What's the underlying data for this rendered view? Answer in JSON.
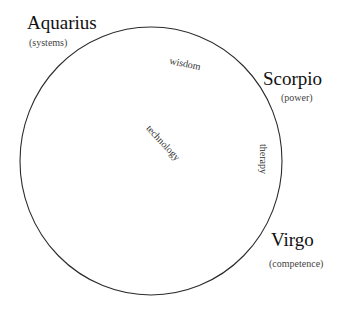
{
  "diagram": {
    "signs": [
      {
        "id": "aquarius",
        "name": "Aquarius",
        "quality": "(systems)"
      },
      {
        "id": "scorpio",
        "name": "Scorpio",
        "quality": "(power)"
      },
      {
        "id": "virgo",
        "name": "Virgo",
        "quality": "(competence)"
      }
    ],
    "inner_labels": [
      {
        "id": "wisdom",
        "text": "wisdom"
      },
      {
        "id": "technology",
        "text": "technology"
      },
      {
        "id": "therapy",
        "text": "therapy"
      }
    ],
    "colors": {
      "circle_stroke": "#2b2b2b",
      "sign_text": "#111111",
      "quality_text": "#444444",
      "inner_text": "#333333",
      "background": "#ffffff"
    }
  }
}
